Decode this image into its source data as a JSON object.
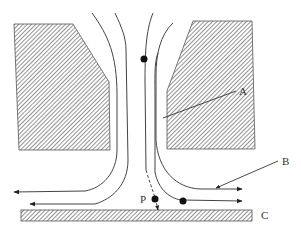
{
  "figure": {
    "title": "",
    "labels": {
      "A": "A",
      "B": "B",
      "C": "C",
      "P": "P"
    },
    "colors": {
      "line": "#444444",
      "hatch": "#666666",
      "particle": "#111111",
      "background": "#ffffff"
    },
    "elements": {
      "blocks": [
        "left-block",
        "right-block",
        "plate-C"
      ],
      "streamlines": [
        "left-outer",
        "left-inner",
        "center",
        "right-inner",
        "right-outer"
      ],
      "particles": [
        "particle-upper",
        "particle-P",
        "particle-right"
      ]
    }
  }
}
